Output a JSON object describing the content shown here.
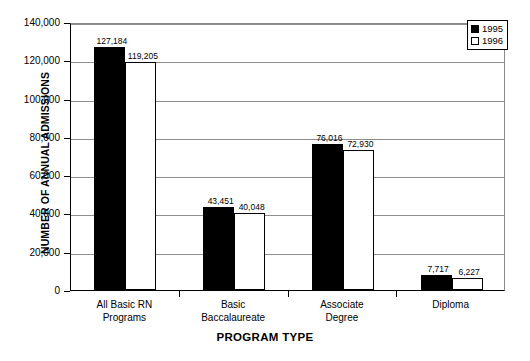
{
  "chart_data": {
    "type": "bar",
    "title": "",
    "subtitle": "",
    "xlabel": "PROGRAM TYPE",
    "ylabel": "NUMBER OF ANNUAL ADMISSIONS",
    "categories": [
      "All Basic RN\nPrograms",
      "Basic\nBaccalaureate",
      "Associate\nDegree",
      "Diploma"
    ],
    "category_lines": [
      [
        "All Basic RN",
        "Programs"
      ],
      [
        "Basic",
        "Baccalaureate"
      ],
      [
        "Associate",
        "Degree"
      ],
      [
        "Diploma",
        ""
      ]
    ],
    "series": [
      {
        "name": "1995",
        "color": "#000000",
        "fill": "solid",
        "values": [
          127184,
          119205,
          76016,
          72930
        ],
        "values_by_category": [
          127184,
          43451,
          76016,
          7717
        ],
        "value_labels": [
          "127,184",
          "43,451",
          "76,016",
          "7,717"
        ]
      },
      {
        "name": "1996",
        "color": "#ffffff",
        "fill": "hollow",
        "values_by_category": [
          119205,
          40048,
          72930,
          6227
        ],
        "value_labels": [
          "119,205",
          "40,048",
          "72,930",
          "6,227"
        ]
      }
    ],
    "ylim": [
      0,
      140000
    ],
    "ytick_values": [
      0,
      20000,
      40000,
      60000,
      80000,
      100000,
      120000,
      140000
    ],
    "ytick_labels": [
      "0",
      "20,000",
      "40,000",
      "60,000",
      "80,000",
      "100,000",
      "120,000",
      "140,000"
    ],
    "grid": true,
    "grid_axis": "y",
    "legend_position": "top-right-inside",
    "legend_entries": [
      "1995",
      "1996"
    ]
  },
  "axis": {
    "y_title": "NUMBER OF ANNUAL ADMISSIONS",
    "x_title": "PROGRAM TYPE"
  },
  "legend": {
    "entries": [
      {
        "label": "1995"
      },
      {
        "label": "1996"
      }
    ]
  },
  "colors": {
    "series_1995": "#000000",
    "series_1996": "#FFFFFF",
    "axis": "#000000",
    "grid": "#8E8E8E",
    "background": "#FFFFFF"
  }
}
